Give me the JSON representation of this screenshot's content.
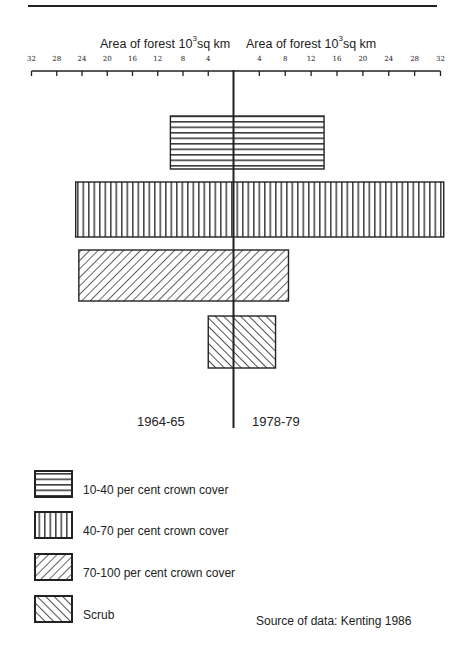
{
  "chart_data": {
    "type": "bar",
    "orientation": "horizontal-butterfly",
    "title": "",
    "xlabel_left": "Area of forest 10^3 sq km",
    "xlabel_right": "Area of forest 10^3 sq km",
    "left_ticks": [
      32,
      28,
      24,
      20,
      16,
      12,
      8,
      4
    ],
    "right_ticks": [
      4,
      8,
      12,
      16,
      20,
      24,
      28,
      32
    ],
    "xlim": [
      0,
      32
    ],
    "categories": [
      "10-40 per cent crown cover",
      "40-70 per cent crown cover",
      "70-100 per cent crown cover",
      "Scrub"
    ],
    "series": [
      {
        "name": "1964-65",
        "side": "left",
        "values": [
          10,
          25,
          24.5,
          4
        ]
      },
      {
        "name": "1978-79",
        "side": "right",
        "values": [
          14,
          32.5,
          8.5,
          6.5
        ]
      }
    ],
    "legend": [
      {
        "pattern": "horizontal",
        "label": "10-40 per cent crown cover"
      },
      {
        "pattern": "vertical",
        "label": "40-70 per cent crown cover"
      },
      {
        "pattern": "diag-up",
        "label": "70-100 per cent crown cover"
      },
      {
        "pattern": "diag-down",
        "label": "Scrub"
      }
    ],
    "grid": false,
    "legend_position": "bottom-left",
    "source": "Source of data: Kenting 1986"
  },
  "labels": {
    "axis_left_main": "Area of forest 10",
    "axis_left_sup": "3",
    "axis_left_unit": "sq km",
    "axis_right_main": "Area of forest 10",
    "axis_right_sup": "3",
    "axis_right_unit": "sq km",
    "period_left": "1964-65",
    "period_right": "1978-79",
    "legend": [
      "10-40 per cent  crown cover",
      "40-70 per cent  crown cover",
      "70-100 per cent  crown cover",
      "Scrub"
    ],
    "source": "Source of data:  Kenting 1986",
    "ticks_left": [
      "32",
      "28",
      "24",
      "20",
      "16",
      "12",
      "8",
      "4"
    ],
    "ticks_right": [
      "4",
      "8",
      "12",
      "16",
      "20",
      "24",
      "28",
      "32"
    ]
  }
}
